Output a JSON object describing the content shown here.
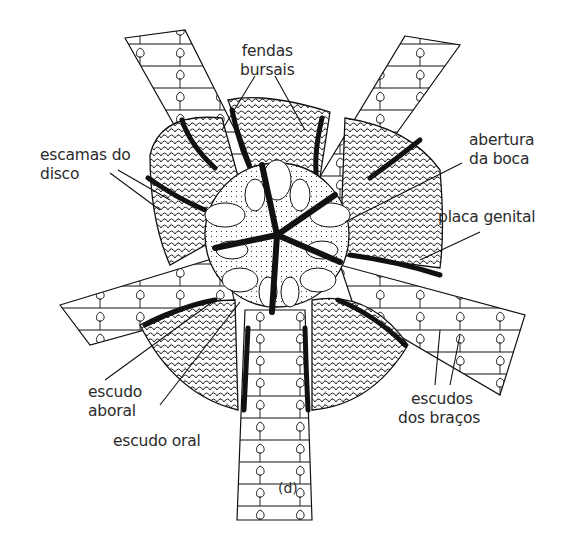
{
  "figure": {
    "caption": "(d)",
    "colors": {
      "ink": "#111111",
      "paper": "#ffffff",
      "text": "#2b2b2b"
    }
  },
  "labels": {
    "fendas_bursais": {
      "line1": "fendas",
      "line2": "bursais"
    },
    "abertura_da_boca": {
      "line1": "abertura",
      "line2": "da boca"
    },
    "placa_genital": {
      "line1": "placa genital"
    },
    "escamas_do_disco": {
      "line1": "escamas do",
      "line2": "disco"
    },
    "escudo_aboral": {
      "line1": "escudo",
      "line2": "aboral"
    },
    "escudo_oral": {
      "line1": "escudo oral"
    },
    "escudos_dos_bracos": {
      "line1": "escudos",
      "line2": "dos braços"
    }
  }
}
